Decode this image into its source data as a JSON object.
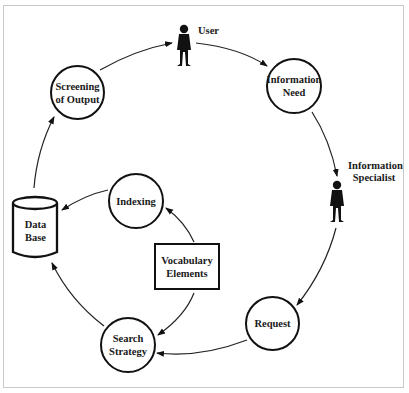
{
  "diagram": {
    "type": "cycle-flow",
    "actors": [
      {
        "id": "user",
        "label": "User"
      },
      {
        "id": "information_specialist",
        "label_line1": "Information",
        "label_line2": "Specialist"
      }
    ],
    "nodes": {
      "information_need": {
        "line1": "Information",
        "line2": "Need",
        "shape": "circle"
      },
      "request": {
        "line1": "Request",
        "shape": "circle"
      },
      "search_strategy": {
        "line1": "Search",
        "line2": "Strategy",
        "shape": "circle"
      },
      "data_base": {
        "line1": "Data",
        "line2": "Base",
        "shape": "cylinder"
      },
      "indexing": {
        "line1": "Indexing",
        "shape": "circle"
      },
      "screening_of_output": {
        "line1": "Screening",
        "line2": "of Output",
        "shape": "circle"
      },
      "vocabulary_elements": {
        "line1": "Vocabulary",
        "line2": "Elements",
        "shape": "rectangle"
      }
    },
    "edges": [
      {
        "from": "Screening of Output",
        "to": "User"
      },
      {
        "from": "User",
        "to": "Information Need"
      },
      {
        "from": "Information Need",
        "to": "Information Specialist"
      },
      {
        "from": "Information Specialist",
        "to": "Request"
      },
      {
        "from": "Request",
        "to": "Search Strategy"
      },
      {
        "from": "Search Strategy",
        "to": "Data Base"
      },
      {
        "from": "Data Base",
        "to": "Screening of Output"
      },
      {
        "from": "Vocabulary Elements",
        "to": "Indexing"
      },
      {
        "from": "Vocabulary Elements",
        "to": "Search Strategy"
      },
      {
        "from": "Indexing",
        "to": "Data Base"
      }
    ]
  }
}
